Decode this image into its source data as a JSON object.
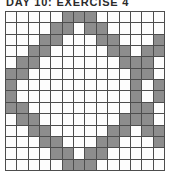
{
  "title": "DAY 10: EXERCISE 4",
  "puzzle": {
    "type": "nonogram-grid",
    "rows": 14,
    "cols": 14,
    "filled_color": "#8d8d8d",
    "empty_color": "#fdfdfd",
    "grid_line_color": "#4d4d4d",
    "legend": {
      "0": "empty",
      "1": "filled"
    },
    "cells": [
      [
        0,
        0,
        0,
        0,
        0,
        1,
        1,
        1,
        0,
        0,
        0,
        0,
        0,
        0
      ],
      [
        0,
        0,
        0,
        0,
        1,
        1,
        0,
        1,
        1,
        0,
        0,
        0,
        0,
        0
      ],
      [
        0,
        0,
        0,
        1,
        1,
        0,
        0,
        0,
        1,
        1,
        0,
        0,
        0,
        1
      ],
      [
        0,
        0,
        1,
        1,
        0,
        0,
        0,
        0,
        0,
        1,
        1,
        0,
        1,
        1
      ],
      [
        0,
        1,
        1,
        0,
        0,
        0,
        0,
        0,
        0,
        0,
        1,
        1,
        1,
        0
      ],
      [
        1,
        1,
        0,
        0,
        0,
        0,
        0,
        0,
        0,
        0,
        0,
        1,
        1,
        0
      ],
      [
        1,
        0,
        0,
        0,
        0,
        0,
        0,
        0,
        0,
        0,
        0,
        1,
        0,
        1
      ],
      [
        1,
        0,
        0,
        0,
        0,
        0,
        0,
        0,
        0,
        0,
        0,
        1,
        0,
        1
      ],
      [
        1,
        1,
        0,
        0,
        0,
        0,
        0,
        0,
        0,
        0,
        0,
        1,
        1,
        0
      ],
      [
        0,
        1,
        1,
        0,
        0,
        0,
        0,
        0,
        0,
        0,
        1,
        1,
        1,
        0
      ],
      [
        0,
        0,
        1,
        1,
        0,
        0,
        0,
        0,
        0,
        1,
        1,
        0,
        1,
        1
      ],
      [
        0,
        0,
        0,
        1,
        1,
        0,
        0,
        0,
        1,
        1,
        0,
        0,
        0,
        1
      ],
      [
        0,
        0,
        0,
        0,
        1,
        1,
        0,
        1,
        1,
        0,
        0,
        0,
        0,
        0
      ],
      [
        0,
        0,
        0,
        0,
        0,
        1,
        1,
        1,
        0,
        0,
        0,
        0,
        0,
        0
      ]
    ]
  }
}
